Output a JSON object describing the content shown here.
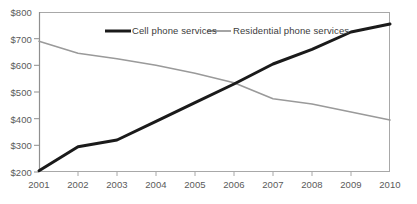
{
  "chart_data": {
    "type": "line",
    "title": "",
    "xlabel": "",
    "ylabel": "",
    "x": [
      2001,
      2002,
      2003,
      2004,
      2005,
      2006,
      2007,
      2008,
      2009,
      2010
    ],
    "categories": [
      "2001",
      "2002",
      "2003",
      "2004",
      "2005",
      "2006",
      "2007",
      "2008",
      "2009",
      "2010"
    ],
    "series": [
      {
        "name": "Cell phone services",
        "color": "#1a1a1a",
        "line_width": 3,
        "values": [
          205,
          295,
          320,
          390,
          460,
          530,
          605,
          660,
          725,
          755
        ]
      },
      {
        "name": "Residential phone services",
        "color": "#9a9a9a",
        "line_width": 1.6,
        "values": [
          690,
          645,
          625,
          600,
          570,
          535,
          475,
          455,
          425,
          395
        ]
      }
    ],
    "ylim": [
      200,
      800
    ],
    "xlim": [
      2001,
      2010
    ],
    "ytick_labels": [
      "$200",
      "$300",
      "$400",
      "$500",
      "$600",
      "$700",
      "$800"
    ],
    "ytick_values": [
      200,
      300,
      400,
      500,
      600,
      700,
      800
    ],
    "xtick_labels": [
      "2001",
      "2002",
      "2003",
      "2004",
      "2005",
      "2006",
      "2007",
      "2008",
      "2009",
      "2010"
    ],
    "grid": false,
    "legend_position": "top-inside",
    "axis_color": "#9a9a9a",
    "tick_text_color": "#5a5a5a",
    "background": "#ffffff"
  },
  "legend": {
    "items": [
      {
        "label": "Cell phone services",
        "color": "#1a1a1a"
      },
      {
        "label": "Residential phone services",
        "color": "#9a9a9a"
      }
    ]
  }
}
